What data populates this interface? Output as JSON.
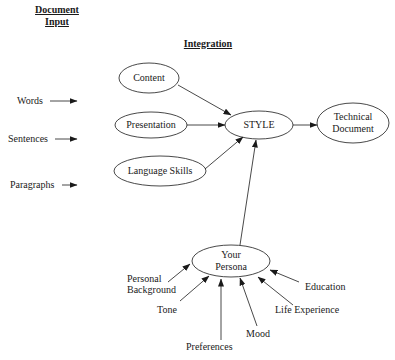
{
  "headers": {
    "document_input_line1": "Document",
    "document_input_line2": "Input",
    "integration": "Integration"
  },
  "inputs": [
    {
      "label": "Words"
    },
    {
      "label": "Sentences"
    },
    {
      "label": "Paragraphs"
    }
  ],
  "nodes": {
    "content": "Content",
    "presentation": "Presentation",
    "language_skills": "Language Skills",
    "style": "STYLE",
    "technical_document_line1": "Technical",
    "technical_document_line2": "Document",
    "persona_line1": "Your",
    "persona_line2": "Persona"
  },
  "persona_factors": {
    "personal_background_line1": "Personal",
    "personal_background_line2": "Background",
    "tone": "Tone",
    "preferences": "Preferences",
    "mood": "Mood",
    "life_experience": "Life Experience",
    "education": "Education"
  },
  "edges": [
    {
      "from": "Content",
      "to": "STYLE"
    },
    {
      "from": "Presentation",
      "to": "STYLE"
    },
    {
      "from": "Language Skills",
      "to": "STYLE"
    },
    {
      "from": "STYLE",
      "to": "Technical Document"
    },
    {
      "from": "Your Persona",
      "to": "STYLE"
    },
    {
      "from": "Personal Background",
      "to": "Your Persona"
    },
    {
      "from": "Tone",
      "to": "Your Persona"
    },
    {
      "from": "Preferences",
      "to": "Your Persona"
    },
    {
      "from": "Mood",
      "to": "Your Persona"
    },
    {
      "from": "Life Experience",
      "to": "Your Persona"
    },
    {
      "from": "Education",
      "to": "Your Persona"
    }
  ]
}
